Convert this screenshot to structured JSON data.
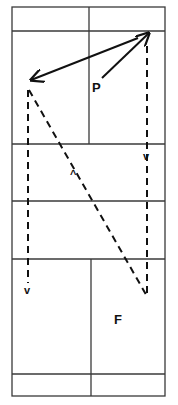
{
  "diagram": {
    "type": "badminton-court-movement",
    "court": {
      "outer": {
        "x1": 12,
        "y1": 7,
        "x2": 165,
        "y2": 396
      },
      "horizontal_lines_y": [
        31,
        144,
        201,
        259,
        374
      ],
      "center_line_top": {
        "x": 89,
        "y1": 7,
        "y2": 144
      },
      "center_line_bottom": {
        "x": 91,
        "y1": 259,
        "y2": 396
      },
      "line_color": "#3a3a3a"
    },
    "labels": {
      "player_p": "P",
      "player_f": "F"
    },
    "direction_markers": {
      "right_down": "v",
      "diagonal_up": "^",
      "left_down": "v"
    },
    "paths": [
      {
        "name": "p-to-top-right",
        "style": "solid",
        "from": [
          102,
          78
        ],
        "to": [
          149,
          33
        ],
        "arrowhead": "end"
      },
      {
        "name": "top-right-to-left",
        "style": "solid",
        "from": [
          149,
          33
        ],
        "to": [
          31,
          80
        ],
        "arrowhead": "both"
      },
      {
        "name": "top-right-down",
        "style": "dashed",
        "from": [
          147,
          46
        ],
        "to": [
          147,
          298
        ]
      },
      {
        "name": "left-diagonal",
        "style": "dashed",
        "from": [
          29,
          88
        ],
        "to": [
          148,
          298
        ]
      },
      {
        "name": "left-down",
        "style": "dashed",
        "from": [
          28,
          88
        ],
        "to": [
          28,
          283
        ]
      }
    ],
    "stroke_color": "#111111"
  }
}
